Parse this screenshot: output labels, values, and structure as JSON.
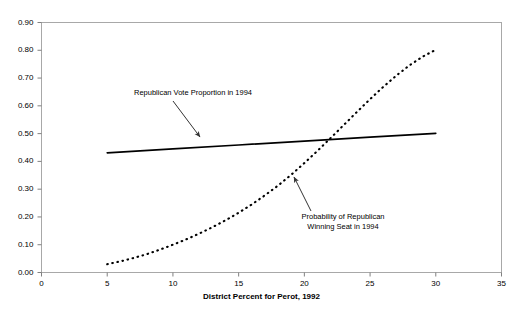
{
  "chart_data": {
    "type": "line",
    "title": "",
    "xlabel": "District Percent for Perot, 1992",
    "ylabel": "",
    "xlim": [
      0,
      35
    ],
    "ylim": [
      0.0,
      0.9
    ],
    "xticks": [
      "0",
      "5",
      "10",
      "15",
      "20",
      "25",
      "30",
      "35"
    ],
    "xtick_values": [
      0,
      5,
      10,
      15,
      20,
      25,
      30,
      35
    ],
    "yticks": [
      "0.00",
      "0.10",
      "0.20",
      "0.30",
      "0.40",
      "0.50",
      "0.60",
      "0.70",
      "0.80",
      "0.90"
    ],
    "ytick_values": [
      0.0,
      0.1,
      0.2,
      0.3,
      0.4,
      0.5,
      0.6,
      0.7,
      0.8,
      0.9
    ],
    "grid": false,
    "legend_position": "none",
    "series": [
      {
        "name": "Republican Vote Proportion in 1994",
        "style": "solid",
        "color": "#000000",
        "x": [
          5,
          10,
          15,
          20,
          25,
          30
        ],
        "values": [
          0.431,
          0.445,
          0.459,
          0.473,
          0.487,
          0.501
        ]
      },
      {
        "name": "Probability of Republican Winning Seat in 1994",
        "style": "dotted",
        "color": "#000000",
        "x": [
          5,
          6,
          7,
          8,
          9,
          10,
          11,
          12,
          13,
          14,
          15,
          16,
          17,
          18,
          19,
          20,
          21,
          22,
          23,
          24,
          25,
          26,
          27,
          28,
          29,
          30
        ],
        "values": [
          0.03,
          0.04,
          0.052,
          0.066,
          0.082,
          0.1,
          0.119,
          0.14,
          0.163,
          0.188,
          0.215,
          0.245,
          0.278,
          0.313,
          0.352,
          0.394,
          0.438,
          0.484,
          0.531,
          0.578,
          0.624,
          0.668,
          0.709,
          0.746,
          0.777,
          0.802
        ]
      }
    ],
    "annotations": [
      {
        "id": "republican-vote-proportion",
        "text": "Republican Vote Proportion in 1994",
        "lines": [
          "Republican Vote Proportion in 1994"
        ],
        "points_to_x": 12.0,
        "points_to_y": 0.452
      },
      {
        "id": "probability-republican-winning",
        "text": "Probability of Republican Winning Seat in 1994",
        "lines": [
          "Probability of Republican",
          "Winning Seat in 1994"
        ],
        "points_to_x": 19.1,
        "points_to_y": 0.349
      }
    ]
  },
  "colors": {
    "plot_frame": "#a8a8a8",
    "series_line": "#000000",
    "annotation_arrow": "#333333",
    "background": "#ffffff",
    "text": "#000000"
  }
}
